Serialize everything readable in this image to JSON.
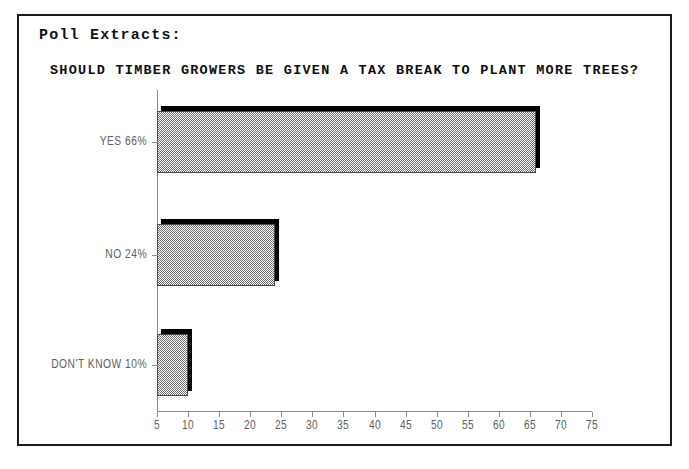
{
  "header": {
    "label": "Poll Extracts:"
  },
  "chart_data": {
    "type": "bar",
    "orientation": "horizontal",
    "title": "SHOULD TIMBER GROWERS BE GIVEN A TAX BREAK TO PLANT MORE TREES?",
    "categories": [
      "YES 66%",
      "NO 24%",
      "DON'T KNOW 10%"
    ],
    "values": [
      66,
      24,
      10
    ],
    "value_unit": "%",
    "xlabel": "",
    "ylabel": "",
    "xlim": [
      5,
      75
    ],
    "xticks": [
      5,
      10,
      15,
      20,
      25,
      30,
      35,
      40,
      45,
      50,
      55,
      60,
      65,
      70,
      75
    ],
    "grid": false,
    "legend": "none",
    "bar_style": "3d-shadow-dither",
    "colors": {
      "bar_fill": "#6f6f6f",
      "bar_shadow": "#000000",
      "axis": "#8a8a8a",
      "frame": "#1b1b1b",
      "text": "#111111",
      "label_text": "#5d5d5d"
    }
  }
}
